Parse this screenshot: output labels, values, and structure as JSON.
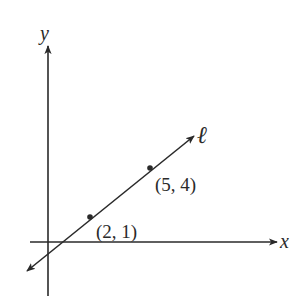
{
  "figure": {
    "type": "coordinate-plane-line",
    "axes": {
      "x_label": "x",
      "y_label": "y"
    },
    "line": {
      "name": "ℓ",
      "passes_through": [
        {
          "x": 2,
          "y": 1,
          "label": "(2, 1)"
        },
        {
          "x": 5,
          "y": 4,
          "label": "(5, 4)"
        }
      ],
      "slope": 1,
      "y_intercept": -1
    },
    "colors": {
      "ink": "#2a2a2a",
      "background": "#ffffff"
    }
  }
}
